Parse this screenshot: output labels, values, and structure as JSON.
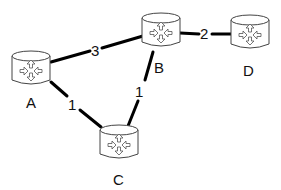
{
  "diagram": {
    "type": "network-topology",
    "nodes": [
      {
        "id": "A",
        "label": "A",
        "icon": "router-icon"
      },
      {
        "id": "B",
        "label": "B",
        "icon": "router-icon"
      },
      {
        "id": "C",
        "label": "C",
        "icon": "router-icon"
      },
      {
        "id": "D",
        "label": "D",
        "icon": "router-icon"
      }
    ],
    "edges": [
      {
        "from": "A",
        "to": "B",
        "weight": "3"
      },
      {
        "from": "B",
        "to": "D",
        "weight": "2"
      },
      {
        "from": "A",
        "to": "C",
        "weight": "1"
      },
      {
        "from": "B",
        "to": "C",
        "weight": "1"
      }
    ]
  }
}
